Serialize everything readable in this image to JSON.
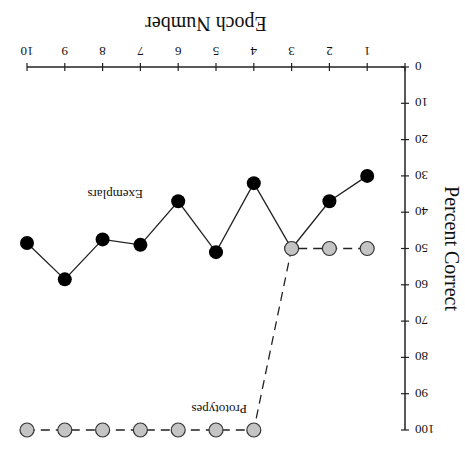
{
  "chart_data": {
    "type": "line",
    "title": "",
    "xlabel": "Epoch Number",
    "ylabel": "Percent Correct",
    "x": [
      1,
      2,
      3,
      4,
      5,
      6,
      7,
      8,
      9,
      10
    ],
    "xlim": [
      0,
      10
    ],
    "ylim": [
      0,
      100
    ],
    "x_ticks": [
      "0",
      "1",
      "2",
      "3",
      "4",
      "5",
      "6",
      "7",
      "8",
      "9",
      "10"
    ],
    "y_ticks": [
      "0",
      "10",
      "20",
      "30",
      "40",
      "50",
      "60",
      "70",
      "80",
      "90",
      "100"
    ],
    "y_axis_inverted": true,
    "x_axis_position": "top",
    "grid": false,
    "rotation_deg": 180,
    "series": [
      {
        "name": "Exemplars",
        "marker": "filled-black-circle",
        "line": "solid",
        "color": "#000000",
        "values": [
          30,
          37,
          50,
          32,
          51,
          37,
          49,
          47.5,
          58.5,
          48.5
        ]
      },
      {
        "name": "Prototypes",
        "marker": "grey-circle",
        "line": "dashed",
        "color": "#c0c0c0",
        "values": [
          50,
          50,
          50,
          100,
          100,
          100,
          100,
          100,
          100,
          100
        ]
      }
    ],
    "annotations": [
      {
        "text": "Exemplars",
        "near_epoch": 7
      },
      {
        "text": "Prototypes",
        "near_epoch": 4
      }
    ]
  }
}
